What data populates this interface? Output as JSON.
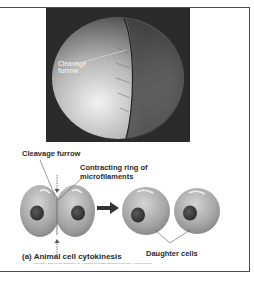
{
  "photo": {
    "label": "Cleavage\nfurrow",
    "icon": "cleavage-furrow-micrograph"
  },
  "diagram": {
    "labels": {
      "cleavage_furrow": "Cleavage furrow",
      "contracting_ring": "Contracting ring of\nmicrofilaments",
      "daughter_cells": "Daughter cells"
    },
    "caption": "(a) Animal cell cytokinesis",
    "arrow_icon": "right-arrow-icon"
  },
  "copyright": "Copyright © 2005 Pearson Education, Inc., publishing as Pearson Benjamin Cummings. All rights reserved.",
  "colors": {
    "cell": "#a9a9a9",
    "nucleus": "#3a3a3a",
    "photo_bg": "#2b2b2b",
    "frame": "#4a4a4a"
  }
}
